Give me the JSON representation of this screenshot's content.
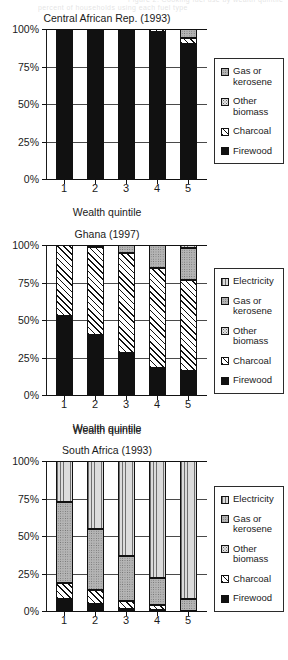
{
  "clipped_header": {
    "line1": "Figure 2. Cooking fuel use by wealth quintile",
    "line2": "percent of households using each fuel type"
  },
  "axis": {
    "y_ticks": [
      "100%",
      "75%",
      "50%",
      "25%",
      "0%"
    ],
    "y_values": [
      100,
      75,
      50,
      25,
      0
    ],
    "x_ticks": [
      "1",
      "2",
      "3",
      "4",
      "5"
    ],
    "x_title": "Wealth quintile"
  },
  "colors": {
    "firewood": "#111111",
    "charcoal": "#ffffff",
    "other_biomass": "#e2e2e2",
    "gas_or_kerosene": "#b4b4b4",
    "electricity": "#dcdcdc",
    "axis": "#111111",
    "grid": "#4a4a4a",
    "legend_border": "#2b2b2b"
  },
  "charts": [
    {
      "id": "central-african-rep",
      "title": "Central African Rep. (1993)",
      "x_title": "Wealth quintile",
      "legend": [
        {
          "label": "Gas or kerosene",
          "key": "gas",
          "fill": "f-gas"
        },
        {
          "label": "Other biomass",
          "key": "otherbio",
          "fill": "f-otherbio"
        },
        {
          "label": "Charcoal",
          "key": "charcoal",
          "fill": "f-charcoal"
        },
        {
          "label": "Firewood",
          "key": "firewood",
          "fill": "f-firewood"
        }
      ],
      "series_order": [
        "firewood",
        "charcoal",
        "otherbio",
        "gas"
      ],
      "bars": [
        {
          "x": "1",
          "firewood": 100.0,
          "charcoal": 0.0,
          "otherbio": 0.0,
          "gas": 0.0
        },
        {
          "x": "2",
          "firewood": 98.5,
          "charcoal": 1.5,
          "otherbio": 0.0,
          "gas": 0.0
        },
        {
          "x": "3",
          "firewood": 100.0,
          "charcoal": 0.0,
          "otherbio": 0.0,
          "gas": 0.0
        },
        {
          "x": "4",
          "firewood": 98.0,
          "charcoal": 2.0,
          "otherbio": 0.0,
          "gas": 0.0
        },
        {
          "x": "5",
          "firewood": 90.0,
          "charcoal": 4.0,
          "otherbio": 0.0,
          "gas": 6.0
        }
      ]
    },
    {
      "id": "ghana",
      "title": "Ghana (1997)",
      "x_title": "Wealth quintile",
      "legend": [
        {
          "label": "Electricity",
          "key": "elec",
          "fill": "f-elec"
        },
        {
          "label": "Gas or kerosene",
          "key": "gas",
          "fill": "f-gas"
        },
        {
          "label": "Other biomass",
          "key": "otherbio",
          "fill": "f-otherbio"
        },
        {
          "label": "Charcoal",
          "key": "charcoal",
          "fill": "f-charcoal"
        },
        {
          "label": "Firewood",
          "key": "firewood",
          "fill": "f-firewood"
        }
      ],
      "series_order": [
        "firewood",
        "charcoal",
        "otherbio",
        "gas",
        "elec"
      ],
      "bars": [
        {
          "x": "1",
          "firewood": 53.0,
          "charcoal": 47.0,
          "otherbio": 0.0,
          "gas": 0.0,
          "elec": 0.0
        },
        {
          "x": "2",
          "firewood": 40.0,
          "charcoal": 58.5,
          "otherbio": 0.0,
          "gas": 1.5,
          "elec": 0.0
        },
        {
          "x": "3",
          "firewood": 28.0,
          "charcoal": 67.0,
          "otherbio": 0.0,
          "gas": 5.0,
          "elec": 0.0
        },
        {
          "x": "4",
          "firewood": 18.0,
          "charcoal": 67.0,
          "otherbio": 0.0,
          "gas": 15.0,
          "elec": 0.0
        },
        {
          "x": "5",
          "firewood": 16.0,
          "charcoal": 61.0,
          "otherbio": 0.0,
          "gas": 21.0,
          "elec": 2.0
        }
      ]
    },
    {
      "id": "south-africa",
      "title": "South Africa (1993)",
      "x_title": "Wealth quintile",
      "legend": [
        {
          "label": "Electricity",
          "key": "elec",
          "fill": "f-elec"
        },
        {
          "label": "Gas or kerosene",
          "key": "gas",
          "fill": "f-gas"
        },
        {
          "label": "Other biomass",
          "key": "otherbio",
          "fill": "f-otherbio"
        },
        {
          "label": "Charcoal",
          "key": "charcoal",
          "fill": "f-charcoal"
        },
        {
          "label": "Firewood",
          "key": "firewood",
          "fill": "f-firewood"
        }
      ],
      "series_order": [
        "firewood",
        "charcoal",
        "otherbio",
        "gas",
        "elec"
      ],
      "bars": [
        {
          "x": "1",
          "firewood": 8.0,
          "charcoal": 11.0,
          "otherbio": 0.0,
          "gas": 54.0,
          "elec": 27.0
        },
        {
          "x": "2",
          "firewood": 5.0,
          "charcoal": 9.0,
          "otherbio": 0.0,
          "gas": 41.0,
          "elec": 45.0
        },
        {
          "x": "3",
          "firewood": 1.5,
          "charcoal": 5.5,
          "otherbio": 0.0,
          "gas": 30.0,
          "elec": 63.0
        },
        {
          "x": "4",
          "firewood": 0.8,
          "charcoal": 3.2,
          "otherbio": 0.0,
          "gas": 18.0,
          "elec": 78.0
        },
        {
          "x": "5",
          "firewood": 0.0,
          "charcoal": 0.0,
          "otherbio": 0.0,
          "gas": 8.0,
          "elec": 92.0
        }
      ]
    }
  ],
  "chart_data": {
    "type": "bar",
    "subtype": "stacked-100-percent",
    "xlabel": "Wealth quintile",
    "ylabel": "",
    "ylim": [
      0,
      100
    ],
    "ytick_labels": [
      "0%",
      "25%",
      "50%",
      "75%",
      "100%"
    ],
    "grid": true,
    "legend_position": "right",
    "categories": [
      "1",
      "2",
      "3",
      "4",
      "5"
    ],
    "panels": [
      {
        "title": "Central African Rep. (1993)",
        "series": [
          {
            "name": "Firewood",
            "values": [
              100.0,
              98.5,
              100.0,
              98.0,
              90.0
            ]
          },
          {
            "name": "Charcoal",
            "values": [
              0.0,
              1.5,
              0.0,
              2.0,
              4.0
            ]
          },
          {
            "name": "Other biomass",
            "values": [
              0.0,
              0.0,
              0.0,
              0.0,
              0.0
            ]
          },
          {
            "name": "Gas or kerosene",
            "values": [
              0.0,
              0.0,
              0.0,
              0.0,
              6.0
            ]
          }
        ]
      },
      {
        "title": "Ghana (1997)",
        "series": [
          {
            "name": "Firewood",
            "values": [
              53.0,
              40.0,
              28.0,
              18.0,
              16.0
            ]
          },
          {
            "name": "Charcoal",
            "values": [
              47.0,
              58.5,
              67.0,
              67.0,
              61.0
            ]
          },
          {
            "name": "Other biomass",
            "values": [
              0.0,
              0.0,
              0.0,
              0.0,
              0.0
            ]
          },
          {
            "name": "Gas or kerosene",
            "values": [
              0.0,
              1.5,
              5.0,
              15.0,
              21.0
            ]
          },
          {
            "name": "Electricity",
            "values": [
              0.0,
              0.0,
              0.0,
              0.0,
              2.0
            ]
          }
        ]
      },
      {
        "title": "South Africa (1993)",
        "series": [
          {
            "name": "Firewood",
            "values": [
              8.0,
              5.0,
              1.5,
              0.8,
              0.0
            ]
          },
          {
            "name": "Charcoal",
            "values": [
              11.0,
              9.0,
              5.5,
              3.2,
              0.0
            ]
          },
          {
            "name": "Other biomass",
            "values": [
              0.0,
              0.0,
              0.0,
              0.0,
              0.0
            ]
          },
          {
            "name": "Gas or kerosene",
            "values": [
              54.0,
              41.0,
              30.0,
              18.0,
              8.0
            ]
          },
          {
            "name": "Electricity",
            "values": [
              27.0,
              45.0,
              63.0,
              78.0,
              92.0
            ]
          }
        ]
      }
    ]
  }
}
